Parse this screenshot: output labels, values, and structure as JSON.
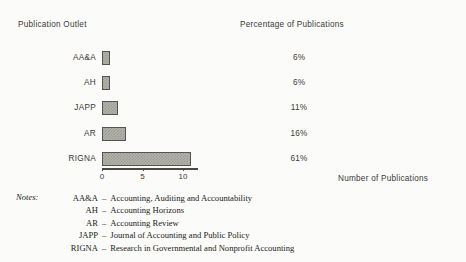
{
  "headers": {
    "left": "Publication Outlet",
    "right": "Percentage of Publications"
  },
  "axis_title": "Number of Publications",
  "notes": {
    "label": "Notes:",
    "dash": "–",
    "items": [
      {
        "abbr": "AA&A",
        "expansion": "Accounting, Auditing and Accountability"
      },
      {
        "abbr": "AH",
        "expansion": "Accounting Horizons"
      },
      {
        "abbr": "AR",
        "expansion": "Accounting Review"
      },
      {
        "abbr": "JAPP",
        "expansion": "Journal of Accounting and Public Policy"
      },
      {
        "abbr": "RIGNA",
        "expansion": "Research in Governmental and Nonprofit Accounting"
      }
    ]
  },
  "colors": {
    "background": "#fbfbf9",
    "bar_fill": "#b4b3ab",
    "bar_dither": "#9b9a92",
    "bar_border": "#55544e",
    "text": "#2b2b2b",
    "axis": "#4a4944"
  },
  "chart_data": {
    "type": "bar",
    "orientation": "horizontal",
    "title": "",
    "xlabel": "Number of Publications",
    "ylabel": "Publication Outlet",
    "xlim": [
      0,
      11.8
    ],
    "xticks": [
      0,
      5,
      10
    ],
    "xtick_labels": [
      "0",
      "5",
      "10"
    ],
    "grid": false,
    "legend": false,
    "categories": [
      "AA&A",
      "AH",
      "JAPP",
      "AR",
      "RIGNA"
    ],
    "values": [
      1,
      1,
      2,
      3,
      11
    ],
    "data_labels": [
      "6%",
      "6%",
      "11%",
      "16%",
      "61%"
    ],
    "percentages": [
      6,
      6,
      11,
      16,
      61
    ],
    "series": [
      {
        "name": "Number of Publications",
        "values": [
          1,
          1,
          2,
          3,
          11
        ]
      }
    ]
  }
}
